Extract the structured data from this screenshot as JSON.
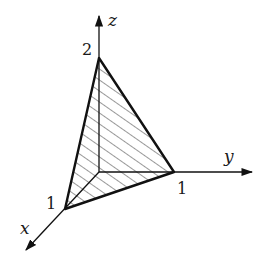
{
  "diagram": {
    "type": "3d-coordinate-plane-tetrahedron",
    "axes": {
      "x": {
        "label": "x"
      },
      "y": {
        "label": "y"
      },
      "z": {
        "label": "z"
      }
    },
    "intercepts": {
      "x": "1",
      "y": "1",
      "z": "2"
    },
    "shaded_region": "triangle with vertices (1,0,0), (0,1,0), (0,0,2)",
    "colors": {
      "stroke": "#111111",
      "hatch": "#333333",
      "background": "#ffffff"
    }
  }
}
